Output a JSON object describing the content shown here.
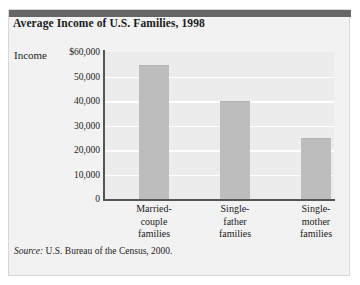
{
  "figure": {
    "title": "Average Income of U.S. Families, 1998",
    "axis_title": "Income",
    "source_label": "Source:",
    "source_text": " U.S. Bureau of the Census, 2000.",
    "colors": {
      "top_rule": "#666666",
      "panel_background": "#f2f2f2",
      "plot_background": "#ececec",
      "bar_fill": "#bdbdbd",
      "gridline": "#ffffff",
      "axis_line": "#555555",
      "text": "#1a1a1a"
    }
  },
  "chart_data": {
    "type": "bar",
    "title": "Average Income of U.S. Families, 1998",
    "xlabel": "",
    "ylabel": "Income",
    "ylim": [
      0,
      60000
    ],
    "grid": true,
    "legend": "none",
    "categories": [
      "Married-couple families",
      "Single-father families",
      "Single-mother families"
    ],
    "category_lines": [
      [
        "Married-",
        "couple",
        "families"
      ],
      [
        "Single-",
        "father",
        "families"
      ],
      [
        "Single-",
        "mother",
        "families"
      ]
    ],
    "values": [
      54500,
      40000,
      25000
    ],
    "ytick_values": [
      60000,
      50000,
      40000,
      30000,
      20000,
      10000,
      0
    ],
    "ytick_labels": [
      "$60,000",
      "50,000",
      "40,000",
      "30,000",
      "20,000",
      "10,000",
      "0"
    ],
    "source": "Source: U.S. Bureau of the Census, 2000."
  }
}
